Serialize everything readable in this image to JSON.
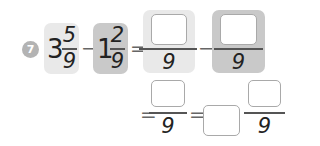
{
  "problem": {
    "number": "7",
    "minuend": {
      "whole": "3",
      "numerator": "5",
      "denominator": "9"
    },
    "subtrahend": {
      "whole": "1",
      "numerator": "2",
      "denominator": "9"
    },
    "operators": {
      "minus": "−",
      "equals": "="
    },
    "step1": {
      "first": {
        "numerator_value": "",
        "denominator": "9"
      },
      "second": {
        "numerator_value": "",
        "denominator": "9"
      }
    },
    "step2": {
      "fraction": {
        "numerator_value": "",
        "denominator": "9"
      }
    },
    "step3": {
      "whole_value": "",
      "fraction": {
        "numerator_value": "",
        "denominator": "9"
      }
    }
  },
  "colors": {
    "tile_light": "#e9e9e9",
    "tile_dark": "#c9c9c9",
    "badge": "#b3b3b3",
    "input_border": "#a9a9a9"
  }
}
